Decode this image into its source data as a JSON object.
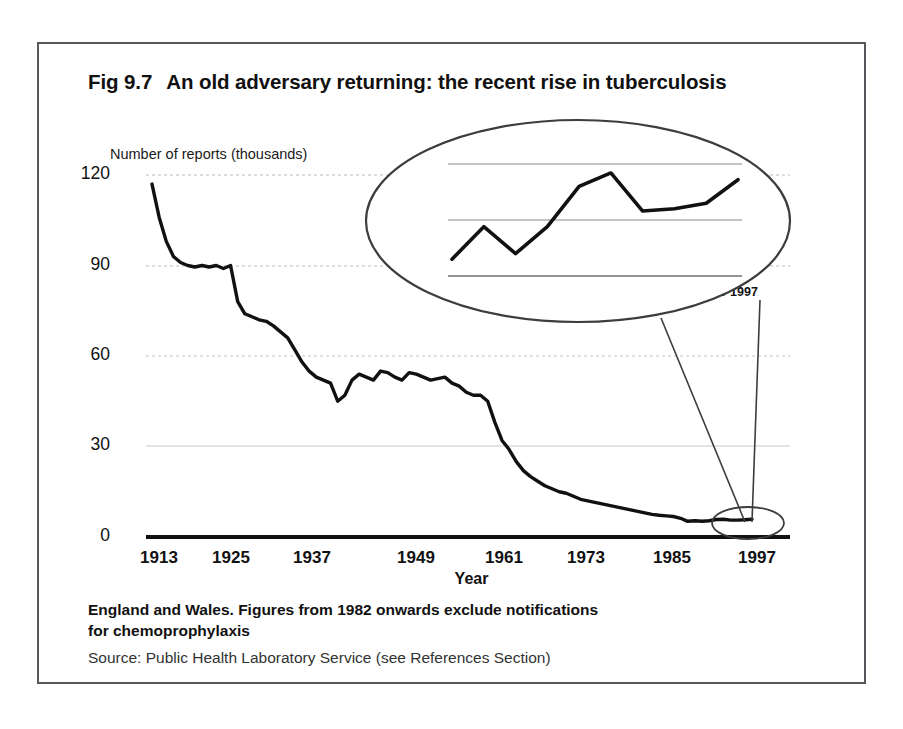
{
  "figure": {
    "number": "Fig 9.7",
    "title": "An old adversary returning: the recent rise in tuberculosis",
    "frame_color": "#55585c"
  },
  "footnote": {
    "line1": "England and Wales. Figures from 1982 onwards exclude notifications",
    "line2": "for chemoprophylaxis",
    "source": "Source: Public Health Laboratory Service (see References Section)"
  },
  "chart_data": {
    "type": "line",
    "title": "An old adversary returning: the recent rise in tuberculosis",
    "xlabel": "Year",
    "ylabel": "Number of reports (thousands)",
    "xlim": [
      1913,
      1998
    ],
    "ylim": [
      0,
      120
    ],
    "xticks": [
      "1913",
      "1925",
      "1937",
      "1949",
      "1961",
      "1973",
      "1985",
      "1997"
    ],
    "yticks": [
      "0",
      "30",
      "60",
      "90",
      "120"
    ],
    "grid": true,
    "legend": "none",
    "x": [
      1913,
      1914,
      1915,
      1916,
      1917,
      1918,
      1919,
      1920,
      1921,
      1922,
      1923,
      1924,
      1925,
      1926,
      1927,
      1928,
      1929,
      1930,
      1931,
      1932,
      1933,
      1934,
      1935,
      1936,
      1937,
      1938,
      1939,
      1940,
      1941,
      1942,
      1943,
      1944,
      1945,
      1946,
      1947,
      1948,
      1949,
      1950,
      1951,
      1952,
      1953,
      1954,
      1955,
      1956,
      1957,
      1958,
      1959,
      1960,
      1961,
      1962,
      1963,
      1964,
      1965,
      1966,
      1967,
      1968,
      1969,
      1970,
      1971,
      1972,
      1973,
      1974,
      1975,
      1976,
      1977,
      1978,
      1979,
      1980,
      1981,
      1982,
      1983,
      1984,
      1985,
      1986,
      1987,
      1988,
      1989,
      1990,
      1991,
      1992,
      1993,
      1994,
      1995,
      1996,
      1997
    ],
    "values": [
      117,
      106,
      98,
      93,
      91,
      90,
      89.5,
      90,
      89.5,
      90,
      89,
      90,
      78,
      74,
      73,
      72,
      71.5,
      70,
      68,
      66,
      62,
      58,
      55,
      53,
      52,
      51,
      45,
      47,
      52,
      54,
      53,
      52,
      55,
      54.5,
      53,
      52,
      54.5,
      54,
      53,
      52,
      52.5,
      53,
      51,
      50,
      48,
      47,
      47,
      45,
      38,
      32,
      29,
      25,
      22,
      20,
      18.5,
      17,
      16,
      15,
      14.5,
      13.5,
      12.5,
      12,
      11.5,
      11,
      10.5,
      10,
      9.5,
      9,
      8.5,
      8,
      7.5,
      7.2,
      7,
      6.8,
      6.2,
      5.2,
      5.4,
      5.2,
      5.4,
      5.8,
      5.9,
      5.6,
      5.6,
      5.7,
      5.9
    ],
    "inset": {
      "type": "line",
      "ylim": [
        5000,
        6100
      ],
      "yticks": [
        "5000",
        "5500",
        "6000"
      ],
      "categories": [
        "1988",
        "1989",
        "1990",
        "1991",
        "1992",
        "1993",
        "1994",
        "1995",
        "1996",
        "1997"
      ],
      "values": [
        5150,
        5440,
        5200,
        5440,
        5800,
        5920,
        5580,
        5600,
        5650,
        5860
      ],
      "grid": true
    }
  }
}
